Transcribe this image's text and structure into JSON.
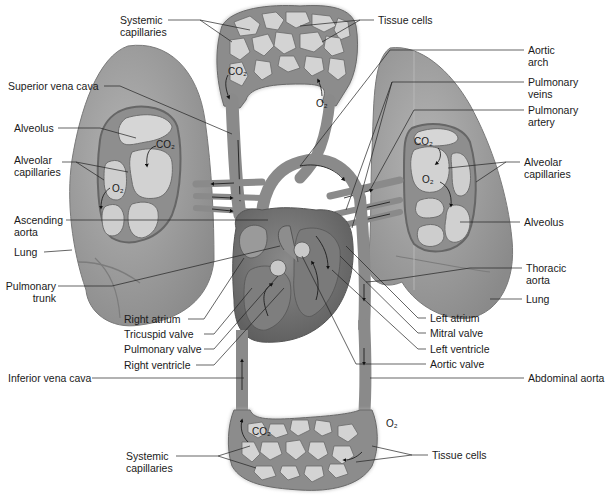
{
  "figure": {
    "header_fragment": "",
    "colors": {
      "background": "#ffffff",
      "lung": "#9a9a9a",
      "lung_dark": "#7f7f7f",
      "vessel": "#8c8c8c",
      "vessel_dark": "#6a6a6a",
      "alveolus": "#d4d4d4",
      "tissue_cell": "#cfcfcf",
      "heart_muscle": "#6e6e6e",
      "leader_line": "#222222"
    }
  },
  "labels": {
    "systemic_capillaries_top": "Systemic\ncapillaries",
    "tissue_cells_top": "Tissue cells",
    "aortic_arch": "Aortic\narch",
    "superior_vena_cava": "Superior vena cava",
    "pulmonary_veins": "Pulmonary\nveins",
    "pulmonary_artery": "Pulmonary\nartery",
    "alveolus_left": "Alveolus",
    "alveolar_capillaries_left": "Alveolar\ncapillaries",
    "alveolar_capillaries_right": "Alveolar\ncapillaries",
    "ascending_aorta": "Ascending\naorta",
    "alveolus_right": "Alveolus",
    "lung_left": "Lung",
    "pulmonary_trunk": "Pulmonary\ntrunk",
    "thoracic_aorta": "Thoracic\naorta",
    "lung_right": "Lung",
    "right_atrium": "Right atrium",
    "left_atrium": "Left atrium",
    "tricuspid_valve": "Tricuspid valve",
    "mitral_valve": "Mitral valve",
    "pulmonary_valve": "Pulmonary valve",
    "left_ventricle": "Left ventricle",
    "right_ventricle": "Right ventricle",
    "aortic_valve": "Aortic valve",
    "inferior_vena_cava": "Inferior vena cava",
    "abdominal_aorta": "Abdominal aorta",
    "systemic_capillaries_bottom": "Systemic\ncapillaries",
    "tissue_cells_bottom": "Tissue cells"
  },
  "gases": {
    "co2_top": "CO₂",
    "o2_top": "O₂",
    "co2_left_lung": "CO₂",
    "o2_left_lung": "O₂",
    "co2_right_lung": "CO₂",
    "o2_right_lung": "O₂",
    "co2_bottom": "CO₂",
    "o2_bottom": "O₂"
  }
}
